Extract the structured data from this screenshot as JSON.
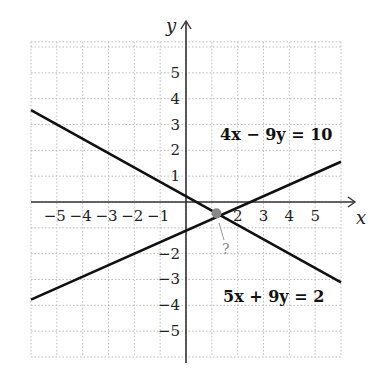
{
  "chart_data": {
    "type": "line",
    "title": "",
    "xlabel": "x",
    "ylabel": "y",
    "xlim": [
      -6,
      6
    ],
    "ylim": [
      -6,
      6.2
    ],
    "grid": true,
    "x_ticks": [
      "-5",
      "-4",
      "-3",
      "-2",
      "-1",
      "2",
      "3",
      "4",
      "5"
    ],
    "y_ticks": [
      "5",
      "4",
      "3",
      "2",
      "1",
      "-2",
      "-3",
      "-4",
      "-5"
    ],
    "series": [
      {
        "name": "4x − 9y = 10",
        "label": "4x − 9y = 10",
        "x": [
          -6,
          6
        ],
        "y": [
          -3.78,
          1.56
        ]
      },
      {
        "name": "5x + 9y = 2",
        "label": "5x + 9y = 2",
        "x": [
          -6,
          6
        ],
        "y": [
          3.56,
          -3.11
        ]
      }
    ],
    "annotations": [
      {
        "type": "point",
        "x": 1.18,
        "y": -0.43,
        "label": "?",
        "color": "#888888"
      }
    ]
  },
  "labels": {
    "x_axis": "x",
    "y_axis": "y",
    "eq1": "4x − 9y = 10",
    "eq2": "5x + 9y = 2",
    "intersection": "?"
  },
  "colors": {
    "line": "#111111",
    "grid": "#bbbbbb",
    "point": "#888888"
  }
}
